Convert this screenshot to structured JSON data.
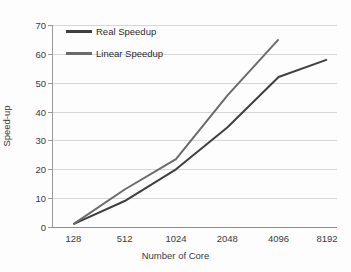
{
  "chart_data": {
    "type": "line",
    "title": "",
    "xlabel": "Number of Core",
    "ylabel": "Speed-up",
    "categories": [
      "128",
      "512",
      "1024",
      "2048",
      "4096",
      "8192"
    ],
    "x_values": [
      128,
      512,
      1024,
      2048,
      4096,
      8192
    ],
    "ylim": [
      0,
      70
    ],
    "y_ticks": [
      0,
      10,
      20,
      30,
      40,
      50,
      60,
      70
    ],
    "grid": true,
    "legend_position": "top-left",
    "series": [
      {
        "name": "Real Speedup",
        "color": "#3f3f3f",
        "categories": [
          "128",
          "512",
          "1024",
          "2048",
          "4096",
          "8192"
        ],
        "values": [
          1,
          9,
          20,
          34.5,
          52,
          58
        ]
      },
      {
        "name": "Linear Speedup",
        "color": "#6b6b6b",
        "categories": [
          "128",
          "512",
          "1024",
          "2048",
          "4096",
          "8192"
        ],
        "values": [
          1,
          13,
          23.5,
          45.5,
          65,
          null
        ]
      }
    ]
  },
  "axes": {
    "y_tick_labels": [
      "70",
      "60",
      "50",
      "40",
      "30",
      "20",
      "10",
      "0"
    ],
    "x_tick_labels": [
      "128",
      "512",
      "1024",
      "2048",
      "4096",
      "8192"
    ],
    "y_axis_title": "Speed-up",
    "x_axis_title": "Number of Core"
  },
  "legend": {
    "items": [
      {
        "label": "Real Speedup",
        "color": "#3f3f3f"
      },
      {
        "label": "Linear Speedup",
        "color": "#6b6b6b"
      }
    ]
  },
  "colors": {
    "background": "#fdfdfd",
    "gridline": "#d6d6d6",
    "axis": "#9a9a9a",
    "text": "#3b3b3b",
    "real_series": "#3f3f3f",
    "linear_series": "#6b6b6b"
  }
}
